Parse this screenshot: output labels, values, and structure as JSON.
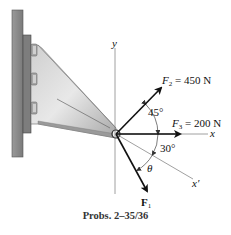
{
  "figure": {
    "caption": "Probs. 2–35/36",
    "axes": {
      "y_label": "y",
      "x_label": "x",
      "xprime_label": "x′"
    },
    "forces": [
      {
        "id": "F2",
        "symbol": "F",
        "subscript": "2",
        "value_text": " = 450 N",
        "magnitude_N": 450,
        "angle_text": "45°"
      },
      {
        "id": "F3",
        "symbol": "F",
        "subscript": "3",
        "value_text": " = 200 N",
        "magnitude_N": 200
      },
      {
        "id": "F1",
        "symbol": "F",
        "subscript": "1",
        "value_text": ""
      }
    ],
    "angles": {
      "a45": "45°",
      "a30": "30°",
      "theta": "θ"
    },
    "colors": {
      "wall": "#8a8a8a",
      "wall_edge": "#555555",
      "plate": "#7d7d7d",
      "bracket_light": "#d9d9d9",
      "bracket_dark": "#9a9a9a",
      "axis": "#888888",
      "arrow": "#111111"
    }
  }
}
